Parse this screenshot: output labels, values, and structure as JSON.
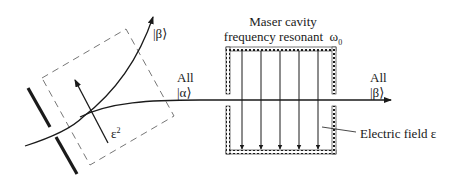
{
  "cavity": {
    "title_line1": "Maser cavity",
    "title_line2": "frequency resonant",
    "omega": "ω",
    "omega_sub": "0"
  },
  "labels": {
    "beta_top": "|β⟩",
    "all_alpha_all": "All",
    "all_alpha_state": "|α⟩",
    "all_beta_all": "All",
    "all_beta_state": "|β⟩",
    "eps_sq": "ε",
    "eps_sq_sup": "2",
    "efield": "Electric field ε"
  },
  "colors": {
    "ink": "#1a1a1a",
    "dashed": "#777777"
  },
  "cavity_field_lines": 5
}
